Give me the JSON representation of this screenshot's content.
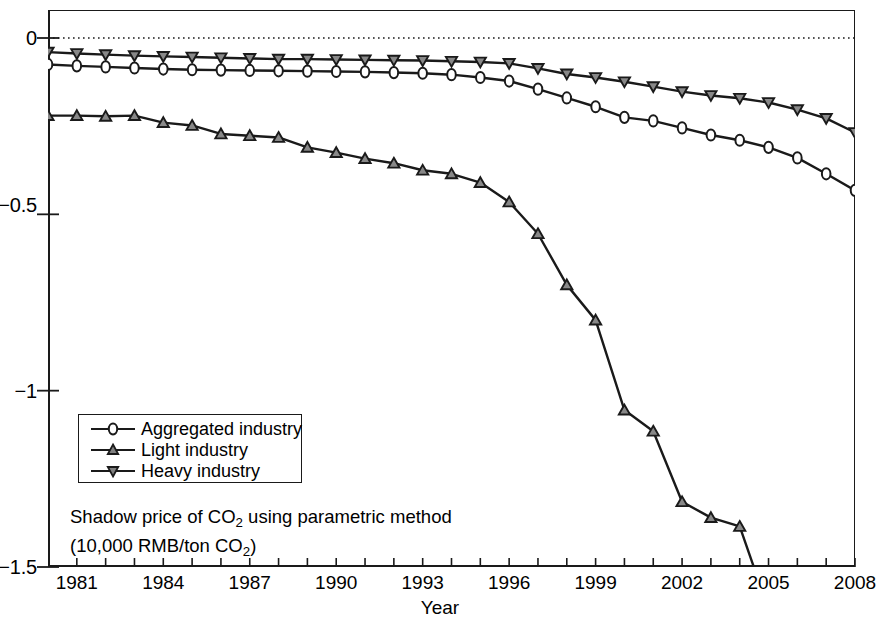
{
  "chart_data": {
    "type": "line",
    "title": "",
    "annotation_line1": "Shadow price of CO₂ using parametric method",
    "annotation_line2": "(10,000 RMB/ton CO₂)",
    "xlabel": "Year",
    "ylabel": "",
    "xlim": [
      1980,
      2008
    ],
    "ylim": [
      -1.5,
      0.05
    ],
    "y_ticks": [
      0,
      -0.5,
      -1,
      -1.5
    ],
    "y_tick_labels": [
      "0",
      "−0.5",
      "−1",
      "−1.5"
    ],
    "x_ticks": [
      1980,
      1981,
      1982,
      1983,
      1984,
      1985,
      1986,
      1987,
      1988,
      1989,
      1990,
      1991,
      1992,
      1993,
      1994,
      1995,
      1996,
      1997,
      1998,
      1999,
      2000,
      2001,
      2002,
      2003,
      2004,
      2005,
      2006,
      2007,
      2008
    ],
    "x_tick_labels": [
      "1981",
      "1984",
      "1987",
      "1990",
      "1993",
      "1996",
      "1999",
      "2002",
      "2005",
      "2008"
    ],
    "x_tick_label_years": [
      1981,
      1984,
      1987,
      1990,
      1993,
      1996,
      1999,
      2002,
      2005,
      2008
    ],
    "grid": false,
    "zero_reference_line": 0,
    "legend_position": "lower-left",
    "x": [
      1980,
      1981,
      1982,
      1983,
      1984,
      1985,
      1986,
      1987,
      1988,
      1989,
      1990,
      1991,
      1992,
      1993,
      1994,
      1995,
      1996,
      1997,
      1998,
      1999,
      2000,
      2001,
      2002,
      2003,
      2004,
      2005,
      2006,
      2007,
      2008
    ],
    "series": [
      {
        "name": "Aggregated industry",
        "marker": "circle",
        "color": "#1a1a1a",
        "values": [
          -0.075,
          -0.079,
          -0.082,
          -0.085,
          -0.088,
          -0.09,
          -0.091,
          -0.092,
          -0.093,
          -0.094,
          -0.095,
          -0.096,
          -0.098,
          -0.1,
          -0.104,
          -0.112,
          -0.122,
          -0.145,
          -0.17,
          -0.195,
          -0.225,
          -0.235,
          -0.255,
          -0.275,
          -0.29,
          -0.31,
          -0.34,
          -0.385,
          -0.432
        ]
      },
      {
        "name": "Light industry",
        "marker": "triangle-up",
        "color": "#1a1a1a",
        "values": [
          -0.22,
          -0.22,
          -0.222,
          -0.22,
          -0.24,
          -0.248,
          -0.272,
          -0.277,
          -0.282,
          -0.31,
          -0.325,
          -0.342,
          -0.355,
          -0.375,
          -0.385,
          -0.41,
          -0.465,
          -0.555,
          -0.7,
          -0.8,
          -1.055,
          -1.115,
          -1.315,
          -1.36,
          -1.385,
          -1.62,
          null,
          null,
          null
        ]
      },
      {
        "name": "Heavy industry",
        "marker": "triangle-down",
        "color": "#1a1a1a",
        "values": [
          -0.04,
          -0.044,
          -0.047,
          -0.05,
          -0.052,
          -0.054,
          -0.056,
          -0.058,
          -0.06,
          -0.06,
          -0.061,
          -0.062,
          -0.063,
          -0.064,
          -0.066,
          -0.068,
          -0.072,
          -0.086,
          -0.102,
          -0.112,
          -0.124,
          -0.138,
          -0.152,
          -0.163,
          -0.171,
          -0.183,
          -0.203,
          -0.228,
          -0.268
        ]
      }
    ]
  },
  "legend": {
    "items": [
      {
        "label": "Aggregated industry",
        "marker": "circle"
      },
      {
        "label": "Light industry",
        "marker": "triangle-up"
      },
      {
        "label": "Heavy industry",
        "marker": "triangle-down"
      }
    ]
  },
  "axes": {
    "x_title": "Year",
    "y_tick_0": "0",
    "y_tick_1": "−0.5",
    "y_tick_2": "−1",
    "y_tick_3": "−1.5"
  },
  "annotation": {
    "line1_pre": "Shadow price of CO",
    "line1_sub": "2",
    "line1_post": " using parametric method",
    "line2_pre": "(10,000 RMB/ton CO",
    "line2_sub": "2",
    "line2_post": ")"
  }
}
